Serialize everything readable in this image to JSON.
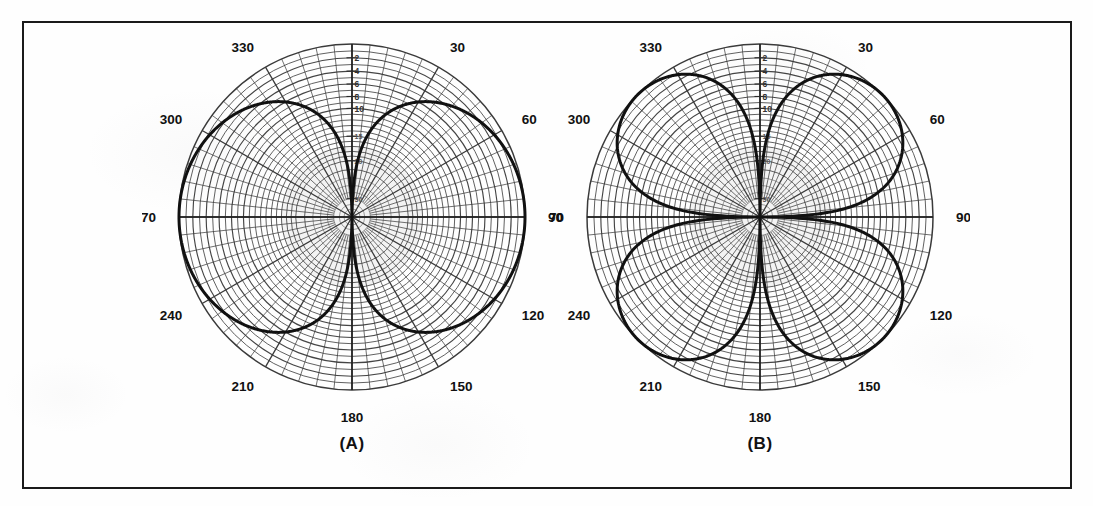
{
  "figure": {
    "border_color": "#1a1a1a",
    "background_color": "#fefefe",
    "grid_color": "#3a3a3a",
    "curve_color": "#111111",
    "panels": [
      {
        "id": "a",
        "caption": "(A)"
      },
      {
        "id": "b",
        "caption": "(B)"
      }
    ]
  },
  "chart_data": [
    {
      "type": "line",
      "subtype": "polar-antenna-radiation-pattern",
      "title": "(A)",
      "xlabel": "Azimuth angle (degrees)",
      "ylabel": "Relative response (dB)",
      "grid": true,
      "legend": null,
      "theta_unit": "degrees",
      "theta_zero_location": "N",
      "theta_direction": "clockwise",
      "angle_tick_labels": [
        "0",
        "30",
        "60",
        "90",
        "120",
        "150",
        "180",
        "210",
        "240",
        "270",
        "300",
        "330"
      ],
      "angle_ticks": [
        0,
        30,
        60,
        90,
        120,
        150,
        180,
        210,
        240,
        270,
        300,
        330
      ],
      "angle_minor_tick_step": 6,
      "radial_tick_labels": [
        "2",
        "4",
        "6",
        "8",
        "10",
        "15",
        "20",
        "30",
        "40"
      ],
      "radial_ticks_db": [
        2,
        4,
        6,
        8,
        10,
        15,
        20,
        30,
        40
      ],
      "radial_scale": "decibel",
      "rlim_db": [
        0,
        40
      ],
      "outer_ring_db": 0,
      "lobe_count": 2,
      "lobe_peak_angles": [
        90,
        270
      ],
      "null_angles": [
        0,
        180
      ],
      "pattern_formula": "|sin(theta)|",
      "series": [
        {
          "name": "Pattern A",
          "theta": [
            0,
            6,
            12,
            18,
            24,
            30,
            36,
            42,
            48,
            54,
            60,
            66,
            72,
            78,
            84,
            90,
            96,
            102,
            108,
            114,
            120,
            126,
            132,
            138,
            144,
            150,
            156,
            162,
            168,
            174,
            180,
            186,
            192,
            198,
            204,
            210,
            216,
            222,
            228,
            234,
            240,
            246,
            252,
            258,
            264,
            270,
            276,
            282,
            288,
            294,
            300,
            306,
            312,
            318,
            324,
            330,
            336,
            342,
            348,
            354,
            360
          ],
          "response_db": [
            40.0,
            19.6,
            13.6,
            10.1,
            7.8,
            6.0,
            4.6,
            3.5,
            2.6,
            1.8,
            1.2,
            0.8,
            0.4,
            0.2,
            0.0,
            0.0,
            0.0,
            0.2,
            0.4,
            0.8,
            1.2,
            1.8,
            2.6,
            3.5,
            4.6,
            6.0,
            7.8,
            10.1,
            13.6,
            19.6,
            40.0,
            19.6,
            13.6,
            10.1,
            7.8,
            6.0,
            4.6,
            3.5,
            2.6,
            1.8,
            1.2,
            0.8,
            0.4,
            0.2,
            0.0,
            0.0,
            0.0,
            0.2,
            0.4,
            0.8,
            1.2,
            1.8,
            2.6,
            3.5,
            4.6,
            6.0,
            7.8,
            10.1,
            13.6,
            19.6,
            40.0
          ]
        }
      ]
    },
    {
      "type": "line",
      "subtype": "polar-antenna-radiation-pattern",
      "title": "(B)",
      "xlabel": "Azimuth angle (degrees)",
      "ylabel": "Relative response (dB)",
      "grid": true,
      "legend": null,
      "theta_unit": "degrees",
      "theta_zero_location": "N",
      "theta_direction": "clockwise",
      "angle_tick_labels": [
        "0",
        "30",
        "60",
        "90",
        "120",
        "150",
        "180",
        "210",
        "240",
        "270",
        "300",
        "330"
      ],
      "angle_ticks": [
        0,
        30,
        60,
        90,
        120,
        150,
        180,
        210,
        240,
        270,
        300,
        330
      ],
      "angle_minor_tick_step": 6,
      "radial_tick_labels": [
        "2",
        "4",
        "6",
        "8",
        "10",
        "15",
        "20",
        "30",
        "40"
      ],
      "radial_ticks_db": [
        2,
        4,
        6,
        8,
        10,
        15,
        20,
        30,
        40
      ],
      "radial_scale": "decibel",
      "rlim_db": [
        0,
        40
      ],
      "outer_ring_db": 0,
      "lobe_count": 4,
      "lobe_peak_angles": [
        30,
        150,
        210,
        330
      ],
      "null_angles": [
        0,
        90,
        180,
        270
      ],
      "pattern_formula": "|sin(2*theta)|",
      "series": [
        {
          "name": "Pattern B",
          "theta": [
            0,
            6,
            12,
            18,
            24,
            30,
            36,
            42,
            48,
            54,
            60,
            66,
            72,
            78,
            84,
            90,
            96,
            102,
            108,
            114,
            120,
            126,
            132,
            138,
            144,
            150,
            156,
            162,
            168,
            174,
            180,
            186,
            192,
            198,
            204,
            210,
            216,
            222,
            228,
            234,
            240,
            246,
            252,
            258,
            264,
            270,
            276,
            282,
            288,
            294,
            300,
            306,
            312,
            318,
            324,
            330,
            336,
            342,
            348,
            354,
            360
          ],
          "response_db": [
            40.0,
            13.6,
            7.8,
            4.6,
            2.6,
            1.2,
            0.4,
            0.0,
            0.0,
            0.4,
            1.2,
            2.6,
            4.6,
            7.8,
            13.6,
            40.0,
            13.6,
            7.8,
            4.6,
            2.6,
            1.2,
            0.4,
            0.0,
            0.0,
            0.4,
            1.2,
            2.6,
            4.6,
            7.8,
            13.6,
            40.0,
            13.6,
            7.8,
            4.6,
            2.6,
            1.2,
            0.4,
            0.0,
            0.0,
            0.4,
            1.2,
            2.6,
            4.6,
            7.8,
            13.6,
            40.0,
            13.6,
            7.8,
            4.6,
            2.6,
            1.2,
            0.4,
            0.0,
            0.0,
            0.4,
            1.2,
            2.6,
            4.6,
            7.8,
            13.6,
            40.0
          ]
        }
      ]
    }
  ]
}
